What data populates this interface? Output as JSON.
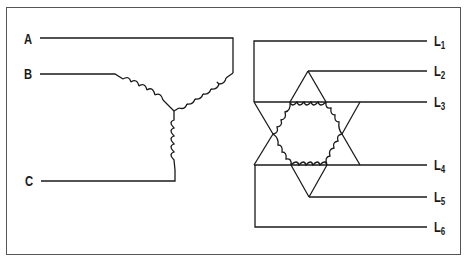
{
  "diagram": {
    "title": "",
    "colors": {
      "line": "#1a1a1a",
      "border": "#555555",
      "background": "#ffffff"
    },
    "wye": {
      "type": "wye (star) three-phase winding",
      "terminals": [
        {
          "label": "A",
          "x": 24,
          "y": 33
        },
        {
          "label": "B",
          "x": 24,
          "y": 68
        },
        {
          "label": "C",
          "x": 25,
          "y": 175
        }
      ]
    },
    "delta_hex": {
      "type": "six-lead hexagon/double-delta winding",
      "terminals": [
        {
          "label": "L",
          "sub": "1",
          "x": 434,
          "y": 35
        },
        {
          "label": "L",
          "sub": "2",
          "x": 434,
          "y": 65
        },
        {
          "label": "L",
          "sub": "3",
          "x": 434,
          "y": 96
        },
        {
          "label": "L",
          "sub": "4",
          "x": 434,
          "y": 159
        },
        {
          "label": "L",
          "sub": "5",
          "x": 434,
          "y": 191
        },
        {
          "label": "L",
          "sub": "6",
          "x": 434,
          "y": 221
        }
      ]
    }
  }
}
